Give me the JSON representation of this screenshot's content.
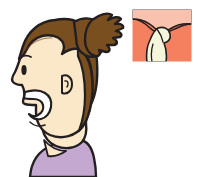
{
  "illustration": {
    "title": "Woman in profile with open mouth and throat close-up inset",
    "type": "medical-anatomical-illustration",
    "canvas": {
      "width": 198,
      "height": 177,
      "background": "#ffffff"
    },
    "subject": {
      "name": "woman-head-profile",
      "description": "Side profile of a woman facing left with her mouth open wide",
      "facing": "left",
      "parts": [
        {
          "name": "hair",
          "label": "Hair with ponytail",
          "color": "#7a4f20"
        },
        {
          "name": "face",
          "label": "Face and neck",
          "color": "#fae8c8"
        },
        {
          "name": "eye",
          "label": "Eye",
          "color": "#231f20"
        },
        {
          "name": "eyebrow",
          "label": "Eyebrow",
          "color": "#231f20"
        },
        {
          "name": "ear",
          "label": "Ear",
          "color": "#fae8c8"
        },
        {
          "name": "mouth",
          "label": "Open mouth",
          "color": "#ffffff"
        },
        {
          "name": "shirt",
          "label": "Shirt",
          "color": "#c4a8d0"
        }
      ]
    },
    "inset": {
      "name": "throat-closeup-panel",
      "label": "Close-up of throat showing uvula and soft palate",
      "x": 132,
      "y": 9,
      "width": 60,
      "height": 53,
      "border_color": "#ffffff",
      "parts": [
        {
          "name": "throat-tissue",
          "label": "Throat mucosa",
          "color": "#f58060"
        },
        {
          "name": "soft-palate",
          "label": "Soft palate",
          "color": "#f8c2ae"
        },
        {
          "name": "uvula",
          "label": "Uvula",
          "color": "#f5f5dc"
        },
        {
          "name": "tonsil",
          "label": "Swollen tonsil",
          "color": "#f5f5dc"
        }
      ]
    },
    "palette": {
      "outline": "#231f20",
      "hair": "#7a4f20",
      "hair_dark": "#6b4419",
      "skin": "#fae8c8",
      "skin_shadow": "#f2d9b0",
      "mouth_white": "#ffffff",
      "shirt": "#c4a8d0",
      "inset_salmon": "#f58060",
      "inset_pink": "#f8c2ae",
      "inset_cream": "#f5f5dc",
      "background": "#ffffff"
    }
  }
}
